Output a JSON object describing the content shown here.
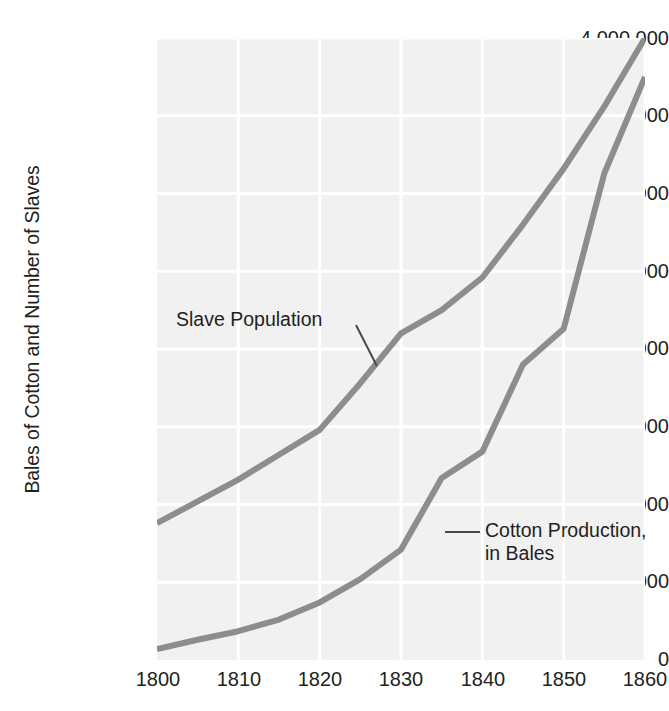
{
  "chart_data": {
    "type": "line",
    "title": "",
    "xlabel": "",
    "ylabel": "Bales of Cotton and Number of Slaves",
    "xlim": [
      1800,
      1860
    ],
    "ylim": [
      0,
      4000000
    ],
    "grid": true,
    "legend_position": "inline-annotations",
    "x_ticks": [
      "1800",
      "1810",
      "1820",
      "1830",
      "1840",
      "1850",
      "1860"
    ],
    "x_tick_values": [
      1800,
      1810,
      1820,
      1830,
      1840,
      1850,
      1860
    ],
    "y_ticks": [
      "0",
      "500,000",
      "1,000,000",
      "1,500,000",
      "2,000,000",
      "2,500,000",
      "3,000,000",
      "3,500,000",
      "4,000,000"
    ],
    "y_tick_values": [
      0,
      500000,
      1000000,
      1500000,
      2000000,
      2500000,
      3000000,
      3500000,
      4000000
    ],
    "x": [
      1800,
      1805,
      1810,
      1815,
      1820,
      1825,
      1830,
      1835,
      1840,
      1845,
      1850,
      1855,
      1860
    ],
    "series": [
      {
        "name": "Slave Population",
        "color": "#8d8d8d",
        "values": [
          880000,
          1020000,
          1160000,
          1320000,
          1480000,
          1780000,
          2100000,
          2250000,
          2460000,
          2800000,
          3160000,
          3560000,
          4000000
        ]
      },
      {
        "name": "Cotton Production, in Bales",
        "color": "#8d8d8d",
        "values": [
          70000,
          130000,
          185000,
          260000,
          370000,
          520000,
          710000,
          1170000,
          1340000,
          1900000,
          2130000,
          3130000,
          3750000
        ]
      }
    ],
    "annotations": [
      {
        "id": "slave",
        "text": "Slave Population",
        "target_series": "Slave Population"
      },
      {
        "id": "cotton",
        "line1": "Cotton Production,",
        "line2": "in Bales",
        "target_series": "Cotton Production, in Bales"
      }
    ],
    "colors": {
      "plot_background": "#f1f1f1",
      "gridline": "#ffffff",
      "line": "#8d8d8d",
      "text": "#231f20"
    }
  }
}
